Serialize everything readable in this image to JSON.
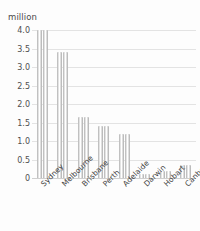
{
  "chart_data": {
    "type": "bar",
    "title": "",
    "subtitle": "",
    "xlabel": "",
    "ylabel": "million",
    "unit_caption": "million",
    "categories": [
      "Sydney",
      "Melbourne",
      "Brisbane",
      "Perth",
      "Adelaide",
      "Darwin",
      "Hobart",
      "Canberra"
    ],
    "values": [
      4.0,
      3.4,
      1.65,
      1.4,
      1.2,
      0.12,
      0.2,
      0.35
    ],
    "series": [
      {
        "name": "Population",
        "values": [
          4.0,
          3.4,
          1.65,
          1.4,
          1.2,
          0.12,
          0.2,
          0.35
        ]
      }
    ],
    "ylim": [
      0,
      4.0
    ],
    "ytick_labels": [
      "4.0",
      "3.5",
      "3.0",
      "2.5",
      "2.0",
      "1.5",
      "1.0",
      "0.5",
      "0"
    ],
    "ytick_values": [
      4.0,
      3.5,
      3.0,
      2.5,
      2.0,
      1.5,
      1.0,
      0.5,
      0
    ],
    "grid": true,
    "grid_axis": "y",
    "legend": false,
    "legend_position": "none",
    "xlabel_rotation": -45,
    "bar_style": "paired-cylinder",
    "bars_per_category": 2,
    "colors": {
      "bar_light": "#ffffff",
      "bar_mid": "#d2d2d2",
      "bar_dark": "#ababab",
      "gridline": "#e3e3e3",
      "baseline": "#cfcfcf",
      "text": "#3f3f3f",
      "background": "#fdfdfd"
    }
  }
}
